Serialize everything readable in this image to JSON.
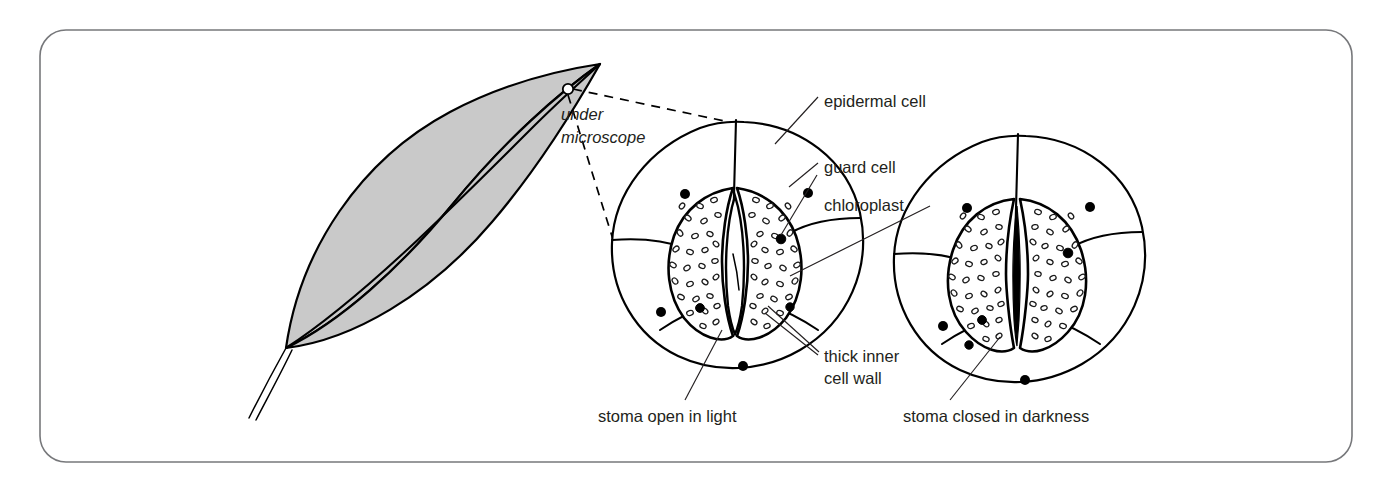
{
  "figure": {
    "frame_color": "#77787b",
    "ink_color": "#000000",
    "leaf_fill_color": "#c9c9c9"
  },
  "leaf": {
    "name": "leaf",
    "marker_label": "microscope-view-point"
  },
  "magnify_note": {
    "line1": "under",
    "line2": "microscope"
  },
  "labels": [
    {
      "id": "epidermal-cell",
      "text": "epidermal cell"
    },
    {
      "id": "guard-cell",
      "text": "guard cell"
    },
    {
      "id": "chloroplast",
      "text": "chloroplast"
    },
    {
      "id": "thick-inner-cell-wall-line1",
      "text": "thick inner"
    },
    {
      "id": "thick-inner-cell-wall-line2",
      "text": "cell wall"
    }
  ],
  "captions": [
    {
      "id": "stoma-open",
      "text": "stoma open in light"
    },
    {
      "id": "stoma-closed",
      "text": "stoma closed in darkness"
    }
  ],
  "stomata": [
    {
      "id": "stoma-open-in-light",
      "state": "open",
      "pore": "open lens-shaped pore"
    },
    {
      "id": "stoma-closed-in-darkness",
      "state": "closed",
      "pore": "closed narrow slit"
    }
  ]
}
